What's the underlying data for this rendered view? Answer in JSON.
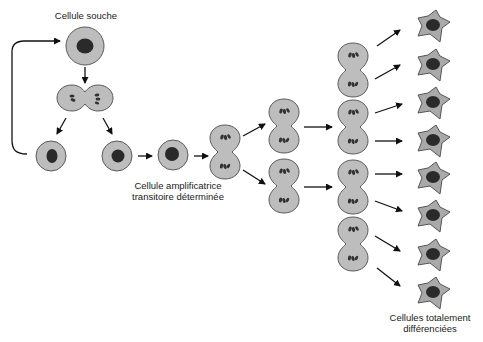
{
  "diagram": {
    "type": "cell lineage / stem cell differentiation",
    "labels": {
      "stem_cell": "Cellule souche",
      "transit_amplifying_line1": "Cellule amplificatrice",
      "transit_amplifying_line2": "transitoire déterminée",
      "differentiated_line1": "Cellules totalement",
      "differentiated_line2": "différenciées"
    },
    "nodes": [
      {
        "id": "stem",
        "kind": "cell",
        "label": "Cellule souche"
      },
      {
        "id": "stem-dividing",
        "kind": "dividing-cell"
      },
      {
        "id": "daughter-stem",
        "kind": "cell"
      },
      {
        "id": "daughter-committed",
        "kind": "cell"
      },
      {
        "id": "transit-cell",
        "kind": "cell",
        "label": "Cellule amplificatrice transitoire déterminée"
      },
      {
        "id": "transit-division-1",
        "kind": "dividing-cell"
      },
      {
        "id": "transit-division-2a",
        "kind": "dividing-cell"
      },
      {
        "id": "transit-division-2b",
        "kind": "dividing-cell"
      },
      {
        "id": "transit-division-3a",
        "kind": "dividing-cell"
      },
      {
        "id": "transit-division-3b",
        "kind": "dividing-cell"
      },
      {
        "id": "transit-division-3c",
        "kind": "dividing-cell"
      },
      {
        "id": "transit-division-3d",
        "kind": "dividing-cell"
      },
      {
        "id": "differentiated",
        "kind": "differentiated-cell",
        "count": 8,
        "label": "Cellules totalement différenciées"
      }
    ],
    "edges": [
      [
        "stem",
        "stem-dividing"
      ],
      [
        "stem-dividing",
        "daughter-stem"
      ],
      [
        "stem-dividing",
        "daughter-committed"
      ],
      [
        "daughter-stem",
        "stem"
      ],
      [
        "daughter-committed",
        "transit-cell"
      ],
      [
        "transit-cell",
        "transit-division-1"
      ],
      [
        "transit-division-1",
        "transit-division-2a"
      ],
      [
        "transit-division-1",
        "transit-division-2b"
      ],
      [
        "transit-division-2a",
        "transit-division-3b"
      ],
      [
        "transit-division-2b",
        "transit-division-3c"
      ],
      [
        "transit-division-3a",
        "differentiated"
      ],
      [
        "transit-division-3b",
        "differentiated"
      ],
      [
        "transit-division-3c",
        "differentiated"
      ],
      [
        "transit-division-3d",
        "differentiated"
      ]
    ],
    "colors": {
      "cytoplasm": "#bdbdbd",
      "membrane": "#5a5a5a",
      "nucleus": "#2a2a2a",
      "differentiated_cytoplasm": "#a9a9a9",
      "arrow": "#111111"
    }
  }
}
